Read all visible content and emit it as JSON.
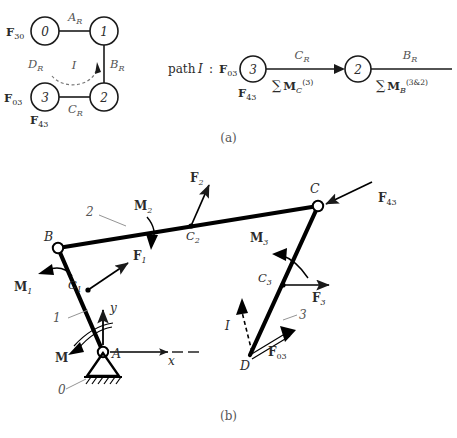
{
  "figure": {
    "caption_a": "(a)",
    "caption_b": "(b)"
  },
  "graph_a": {
    "nodes": [
      {
        "id": "node-0",
        "label": "0",
        "x": 45,
        "y": 31
      },
      {
        "id": "node-1",
        "label": "1",
        "x": 104,
        "y": 31
      },
      {
        "id": "node-2",
        "label": "2",
        "x": 104,
        "y": 97
      },
      {
        "id": "node-3",
        "label": "3",
        "x": 45,
        "y": 97
      }
    ],
    "edge_labels": {
      "top": "A_R",
      "right": "B_R",
      "bottom": "C_R",
      "left": "D_R"
    },
    "edge_label_parts": {
      "top_main": "A",
      "top_sub": "R",
      "right_main": "B",
      "right_sub": "R",
      "bottom_main": "C",
      "bottom_sub": "R",
      "left_main": "D",
      "left_sub": "R"
    },
    "loop_label": "I",
    "external_forces": [
      {
        "name": "F-30",
        "main": "F",
        "sub": "30",
        "x": 6,
        "y": 36
      },
      {
        "name": "F-03",
        "main": "F",
        "sub": "03",
        "x": 4,
        "y": 102
      },
      {
        "name": "F-43",
        "main": "F",
        "sub": "43",
        "x": 30,
        "y": 123
      }
    ]
  },
  "path_expression": {
    "prefix_text": "path",
    "prefix_italic": "I",
    "colon": ":",
    "start_force": {
      "main": "F",
      "sub": "03"
    },
    "under_start_force": {
      "main": "F",
      "sub": "43"
    },
    "nodes": [
      {
        "label": "3",
        "x": 253,
        "y": 69
      },
      {
        "label": "2",
        "x": 358,
        "y": 69
      }
    ],
    "segment1": {
      "above_main": "C",
      "above_sub": "R",
      "below_sum": "∑",
      "below_main": "M",
      "below_sub": "C",
      "below_sup": "(3)"
    },
    "segment2": {
      "above_main": "B",
      "above_sub": "R",
      "below_sum": "∑",
      "below_main": "M",
      "below_sub": "B",
      "below_sup": "(3&2)"
    }
  },
  "mechanism_b": {
    "points": [
      {
        "name": "A",
        "label": "A",
        "x": 103,
        "y": 352,
        "type": "pin-ground"
      },
      {
        "name": "B",
        "label": "B",
        "x": 58,
        "y": 248,
        "type": "pin"
      },
      {
        "name": "C",
        "label": "C",
        "x": 318,
        "y": 206,
        "type": "pin"
      },
      {
        "name": "D",
        "label": "D",
        "x": 250,
        "y": 355,
        "type": "endpoint"
      },
      {
        "name": "C1",
        "main": "C",
        "sub": "1",
        "x": 88,
        "y": 290,
        "type": "mass-center"
      },
      {
        "name": "C2",
        "main": "C",
        "sub": "2",
        "x": 191,
        "y": 226,
        "type": "mass-center"
      },
      {
        "name": "C3",
        "main": "C",
        "sub": "3",
        "x": 283,
        "y": 285,
        "type": "mass-center"
      }
    ],
    "link_labels": [
      {
        "name": "link-1",
        "label": "1",
        "x": 57,
        "y": 318
      },
      {
        "name": "link-2",
        "label": "2",
        "x": 90,
        "y": 212
      },
      {
        "name": "link-3",
        "label": "3",
        "x": 300,
        "y": 316
      },
      {
        "name": "link-0",
        "label": "0",
        "x": 62,
        "y": 385
      }
    ],
    "forces": [
      {
        "name": "F1",
        "main": "F",
        "sub": "1",
        "x": 135,
        "y": 280
      },
      {
        "name": "F2",
        "main": "F",
        "sub": "2",
        "x": 192,
        "y": 178
      },
      {
        "name": "F3",
        "main": "F",
        "sub": "3",
        "x": 317,
        "y": 297
      },
      {
        "name": "F43",
        "main": "F",
        "sub": "43",
        "x": 382,
        "y": 198
      },
      {
        "name": "F03",
        "main": "F",
        "sub": "03",
        "x": 272,
        "y": 352
      }
    ],
    "moments": [
      {
        "name": "M1",
        "main": "M",
        "sub": "1",
        "x": 22,
        "y": 287
      },
      {
        "name": "M2",
        "main": "M",
        "sub": "2",
        "x": 139,
        "y": 207
      },
      {
        "name": "M3",
        "main": "M",
        "sub": "3",
        "x": 256,
        "y": 237
      },
      {
        "name": "M",
        "main": "M",
        "sub": "",
        "x": 62,
        "y": 358
      }
    ],
    "axes": {
      "x_label": "x",
      "y_label": "y"
    },
    "loop_label": "I"
  },
  "colors": {
    "ink": "#1a1a1a",
    "gray_label": "#555555",
    "link": "#000000",
    "background": "#ffffff"
  }
}
